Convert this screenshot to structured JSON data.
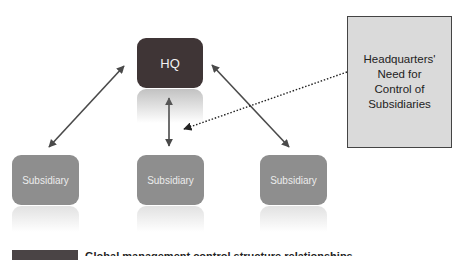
{
  "diagram": {
    "hq": {
      "label": "HQ",
      "color": "#3f3536"
    },
    "subsidiaries": [
      {
        "label": "Subsidiary",
        "color": "#8e8e8e"
      },
      {
        "label": "Subsidiary",
        "color": "#8e8e8e"
      },
      {
        "label": "Subsidiary",
        "color": "#8e8e8e"
      }
    ],
    "callout": {
      "text": "Headquarters'\nNeed for\nControl of\nSubsidiaries",
      "background": "#dadada"
    },
    "connections": [
      {
        "from": "HQ",
        "to": "Subsidiary (left)",
        "type": "bidirectional-arrow"
      },
      {
        "from": "HQ",
        "to": "Subsidiary (center)",
        "type": "bidirectional-arrow"
      },
      {
        "from": "HQ",
        "to": "Subsidiary (right)",
        "type": "bidirectional-arrow"
      },
      {
        "from": "Callout",
        "to": "center arrow",
        "type": "dotted-arrow"
      }
    ],
    "caption": {
      "text": "(caption text cut off at bottom edge)"
    }
  }
}
